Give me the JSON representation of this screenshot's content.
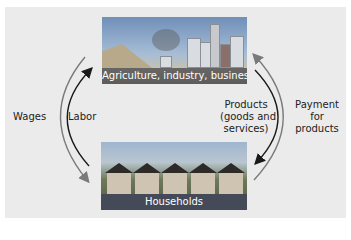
{
  "diagram": {
    "top_node": {
      "caption": "Agriculture, industry, business",
      "image": "city-industry-photo"
    },
    "bottom_node": {
      "caption": "Households",
      "image": "houses-photo"
    },
    "flows": {
      "wages": "Wages",
      "labor": "Labor",
      "products_line1": "Products",
      "products_line2": "(goods and",
      "products_line3": "services)",
      "payment_line1": "Payment",
      "payment_line2": "for",
      "payment_line3": "products"
    },
    "colors": {
      "panel": "#ebebeb",
      "outer_arrows": "#7a7a7a",
      "inner_arrows": "#1a1a1a"
    }
  }
}
